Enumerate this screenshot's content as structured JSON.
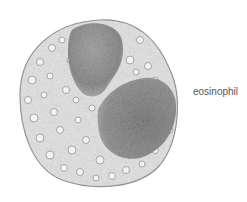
{
  "diagram": {
    "subject": "eosinophil",
    "label": "eosinophil",
    "colors": {
      "background": "#ffffff",
      "cytoplasm": "#d9d9d9",
      "nucleus": "#8a8a8a",
      "outline": "#8f8f8f",
      "label": "#555555"
    }
  }
}
